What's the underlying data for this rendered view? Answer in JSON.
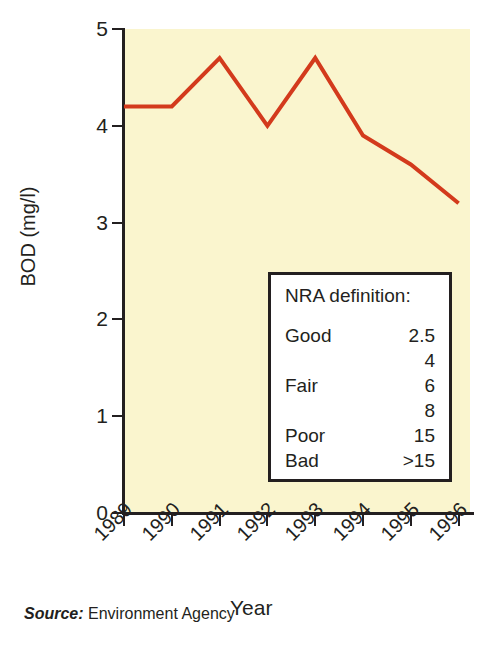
{
  "chart_data": {
    "type": "line",
    "title": "",
    "xlabel": "Year",
    "ylabel": "BOD (mg/l)",
    "categories": [
      "1989",
      "1990",
      "1991",
      "1992",
      "1993",
      "1994",
      "1995",
      "1996"
    ],
    "values": [
      4.2,
      4.2,
      4.7,
      4.0,
      4.7,
      3.9,
      3.6,
      3.2
    ],
    "series": [
      {
        "name": "BOD",
        "values": [
          4.2,
          4.2,
          4.7,
          4.0,
          4.7,
          3.9,
          3.6,
          3.2
        ],
        "color": "#d33a1c"
      }
    ],
    "ylim": [
      0,
      5
    ],
    "ytick_labels": [
      "5",
      "4",
      "3",
      "2",
      "1",
      "0"
    ],
    "ytick_values": [
      5,
      4,
      3,
      2,
      1,
      0
    ],
    "grid": false,
    "legend_position": "inside-bottom-right",
    "plot_background": "#faf5ce",
    "line_color": "#d33a1c",
    "axis_color": "#231f20",
    "xtick_label_rotation": -45
  },
  "legend": {
    "title": "NRA definition:",
    "rows": [
      {
        "label": "Good",
        "value": "2.5"
      },
      {
        "label": "",
        "value": "4"
      },
      {
        "label": "Fair",
        "value": "6"
      },
      {
        "label": "",
        "value": "8"
      },
      {
        "label": "Poor",
        "value": "15"
      },
      {
        "label": "Bad",
        "value": ">15"
      }
    ]
  },
  "source": {
    "label": "Source:",
    "text": " Environment Agency"
  }
}
